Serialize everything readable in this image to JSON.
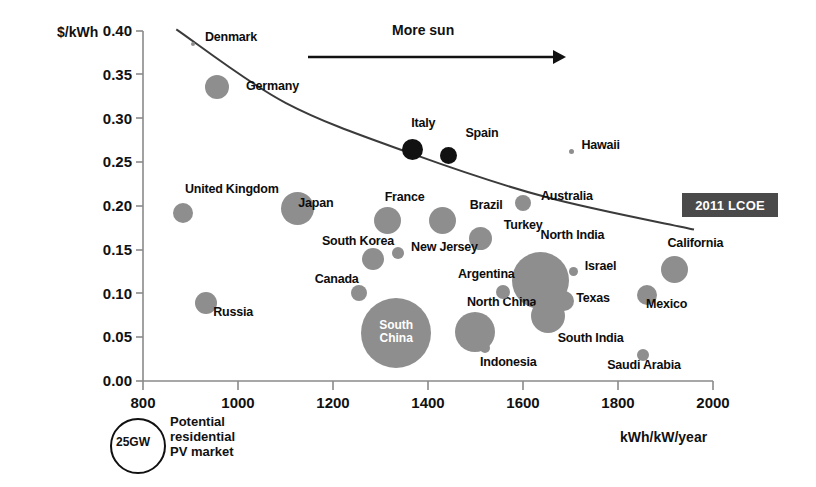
{
  "chart_data": {
    "type": "scatter",
    "title": "",
    "xlabel": "kWh/kW/year",
    "ylabel": "$/kWh",
    "xlim": [
      800,
      2000
    ],
    "ylim": [
      0.0,
      0.4
    ],
    "xticks": [
      "800",
      "1000",
      "1200",
      "1400",
      "1600",
      "1800",
      "2000"
    ],
    "yticks": [
      "0.00",
      "0.05",
      "0.10",
      "0.15",
      "0.20",
      "0.25",
      "0.30",
      "0.35",
      "0.40"
    ],
    "grid": false,
    "legend_position": "right",
    "annotations": {
      "more_sun": "More sun",
      "lcoe_badge": "2011 LCOE",
      "size_legend_value": "25GW",
      "size_legend_caption": "Potential\nresidential\nPV market"
    },
    "bubble_size_meaning": "Potential residential PV market (GW)",
    "points": [
      {
        "name": "Denmark",
        "x": 905,
        "y": 0.385,
        "size": 4,
        "color": "#8e8e8e",
        "label_dx": 10,
        "label_dy": -7
      },
      {
        "name": "Germany",
        "x": 956,
        "y": 0.336,
        "size": 24,
        "color": "#8e8e8e",
        "label_dx": 17,
        "label_dy": -1
      },
      {
        "name": "Italy",
        "x": 1368,
        "y": 0.265,
        "size": 21,
        "color": "#111111",
        "label_dx": -12,
        "label_dy": -26
      },
      {
        "name": "Spain",
        "x": 1444,
        "y": 0.258,
        "size": 17,
        "color": "#111111",
        "label_dx": 8,
        "label_dy": -22
      },
      {
        "name": "Hawaii",
        "x": 1703,
        "y": 0.262,
        "size": 5,
        "color": "#8e8e8e",
        "label_dx": 7,
        "label_dy": -7
      },
      {
        "name": "United Kingdom",
        "x": 884,
        "y": 0.192,
        "size": 20,
        "color": "#8e8e8e",
        "label_dx": -8,
        "label_dy": -24
      },
      {
        "name": "Japan",
        "x": 1126,
        "y": 0.197,
        "size": 33,
        "color": "#8e8e8e",
        "label_dx": -16,
        "label_dy": -6
      },
      {
        "name": "Australia",
        "x": 1600,
        "y": 0.204,
        "size": 16,
        "color": "#8e8e8e",
        "label_dx": 10,
        "label_dy": -7
      },
      {
        "name": "France",
        "x": 1314,
        "y": 0.183,
        "size": 27,
        "color": "#8e8e8e",
        "label_dx": -16,
        "label_dy": -24
      },
      {
        "name": "Brazil",
        "x": 1430,
        "y": 0.183,
        "size": 27,
        "color": "#8e8e8e",
        "label_dx": 14,
        "label_dy": -16
      },
      {
        "name": "Turkey",
        "x": 1510,
        "y": 0.163,
        "size": 23,
        "color": "#8e8e8e",
        "label_dx": 12,
        "label_dy": -13
      },
      {
        "name": "California",
        "x": 1918,
        "y": 0.128,
        "size": 27,
        "color": "#8e8e8e",
        "label_dx": -20,
        "label_dy": -26
      },
      {
        "name": "South Korea",
        "x": 1284,
        "y": 0.139,
        "size": 22,
        "color": "#8e8e8e",
        "label_dx": -62,
        "label_dy": -18
      },
      {
        "name": "New Jersey",
        "x": 1337,
        "y": 0.146,
        "size": 12,
        "color": "#8e8e8e",
        "label_dx": 7,
        "label_dy": -6
      },
      {
        "name": "North India",
        "x": 1636,
        "y": 0.115,
        "size": 57,
        "color": "#8e8e8e",
        "label_dx": -28,
        "label_dy": -45
      },
      {
        "name": "Israel",
        "x": 1706,
        "y": 0.125,
        "size": 9,
        "color": "#8e8e8e",
        "label_dx": 7,
        "label_dy": -6
      },
      {
        "name": "Argentina",
        "x": 1558,
        "y": 0.102,
        "size": 14,
        "color": "#8e8e8e",
        "label_dx": -52,
        "label_dy": -18
      },
      {
        "name": "Canada",
        "x": 1254,
        "y": 0.101,
        "size": 16,
        "color": "#8e8e8e",
        "label_dx": -52,
        "label_dy": -14
      },
      {
        "name": "Texas",
        "x": 1687,
        "y": 0.092,
        "size": 20,
        "color": "#8e8e8e",
        "label_dx": 2,
        "label_dy": -3
      },
      {
        "name": "Mexico",
        "x": 1861,
        "y": 0.098,
        "size": 20,
        "color": "#8e8e8e",
        "label_dx": -11,
        "label_dy": 9
      },
      {
        "name": "Russia",
        "x": 933,
        "y": 0.089,
        "size": 22,
        "color": "#8e8e8e",
        "label_dx": -4,
        "label_dy": 9
      },
      {
        "name": "South China",
        "x": 1333,
        "y": 0.055,
        "size": 70,
        "color": "#8e8e8e",
        "label_dx": 0,
        "label_dy": 0,
        "inner": true
      },
      {
        "name": "North China",
        "x": 1499,
        "y": 0.056,
        "size": 40,
        "color": "#8e8e8e",
        "label_dx": -28,
        "label_dy": -30
      },
      {
        "name": "South India",
        "x": 1652,
        "y": 0.074,
        "size": 34,
        "color": "#8e8e8e",
        "label_dx": -7,
        "label_dy": 22
      },
      {
        "name": "Indonesia",
        "x": 1520,
        "y": 0.038,
        "size": 10,
        "color": "#8e8e8e",
        "label_dx": -10,
        "label_dy": 14
      },
      {
        "name": "Saudi Arabia",
        "x": 1853,
        "y": 0.03,
        "size": 12,
        "color": "#8e8e8e",
        "label_dx": -42,
        "label_dy": 10
      }
    ],
    "trend_line": {
      "label": "2011 LCOE",
      "points": [
        {
          "x": 870,
          "y": 0.402
        },
        {
          "x": 1100,
          "y": 0.318
        },
        {
          "x": 1370,
          "y": 0.259
        },
        {
          "x": 1650,
          "y": 0.21
        },
        {
          "x": 1960,
          "y": 0.173
        }
      ]
    },
    "colors": {
      "bubble_grey": "#8e8e8e",
      "bubble_dark": "#111111",
      "badge_bg": "#4a4a4a",
      "axis": "#8a8a8a",
      "text": "#111111"
    }
  }
}
